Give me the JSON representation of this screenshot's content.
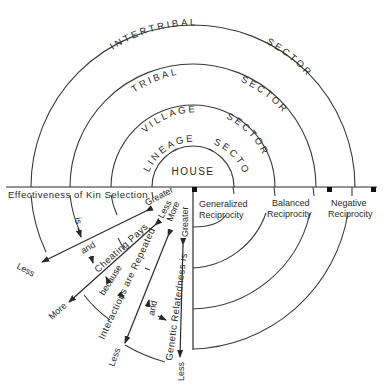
{
  "diagram": {
    "sectors": [
      {
        "name": "INTERTRIBAL",
        "suffix": "SECTOR"
      },
      {
        "name": "TRIBAL",
        "suffix": "SECTOR"
      },
      {
        "name": "VILLAGE",
        "suffix": "SECTOR"
      },
      {
        "name": "LINEAGE",
        "suffix": "SECTOR"
      }
    ],
    "core_label": "HOUSE",
    "axis_label": "Effectiveness of Kin Selection",
    "reciprocity": [
      {
        "line1": "Generalized",
        "line2": "Reciprocity"
      },
      {
        "line1": "Balanced",
        "line2": "Reciprocity"
      },
      {
        "line1": "Negative",
        "line2": "Reciprocity"
      }
    ],
    "arrows": [
      {
        "label": "Effectiveness of Kin Selection",
        "high": "Greater",
        "low": "Less"
      },
      {
        "label": "Cheating Pays",
        "high": "Less",
        "low": "More"
      },
      {
        "label": "Interactions are Repeated",
        "high": "More",
        "low": "Less"
      },
      {
        "label": "Genetic Relatedness is",
        "high": "Greater",
        "low": "Less"
      }
    ],
    "connectors": {
      "is": "is",
      "and1": "and",
      "because": "because",
      "and2": "and"
    }
  },
  "colors": {
    "ink": "#2a2a2a",
    "background": "#ffffff"
  }
}
